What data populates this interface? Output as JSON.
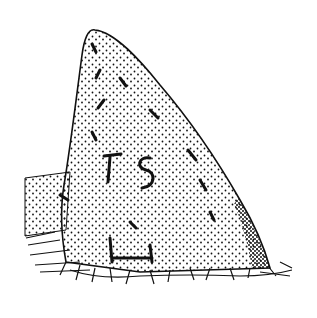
{
  "image": {
    "description": "Stipple ink drawing of a triangular standing stone with carved letters T S and a cross/H-like mark near the base, set in grass",
    "inscription": [
      "T",
      "S"
    ],
    "colors": {
      "background": "#ffffff",
      "ink": "#111111"
    }
  }
}
